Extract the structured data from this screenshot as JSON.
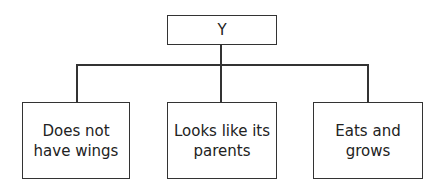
{
  "diagram": {
    "root": {
      "label": "Y"
    },
    "children": [
      {
        "label": "Does not\nhave wings"
      },
      {
        "label": "Looks like its\nparents"
      },
      {
        "label": "Eats and\ngrows"
      }
    ]
  }
}
